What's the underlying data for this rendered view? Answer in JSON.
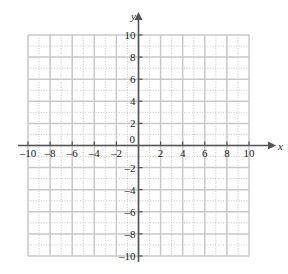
{
  "figure": {
    "title": "",
    "axis_labels": {
      "x": "x",
      "y": "y"
    },
    "origin_label": "0"
  },
  "chart_data": {
    "type": "scatter",
    "title": "",
    "xlabel": "x",
    "ylabel": "y",
    "xlim": [
      -10,
      10
    ],
    "ylim": [
      -10,
      10
    ],
    "grid": true,
    "grid_major_step": 2,
    "grid_minor_step": 1,
    "legend": "none",
    "series": [],
    "x_tick_labels": [
      "-10",
      "-8",
      "-6",
      "-4",
      "-2",
      "0",
      "2",
      "4",
      "6",
      "8",
      "10"
    ],
    "y_tick_labels": [
      "-10",
      "-8",
      "-6",
      "-4",
      "-2",
      "0",
      "2",
      "4",
      "6",
      "8",
      "10"
    ],
    "x_tick_values": [
      -10,
      -8,
      -6,
      -4,
      -2,
      0,
      2,
      4,
      6,
      8,
      10
    ],
    "y_tick_values": [
      -10,
      -8,
      -6,
      -4,
      -2,
      0,
      2,
      4,
      6,
      8,
      10
    ],
    "annotations": []
  },
  "ticks": {
    "x_negative": [
      {
        "value": -10,
        "label": "–10"
      },
      {
        "value": -8,
        "label": "–8"
      },
      {
        "value": -6,
        "label": "–6"
      },
      {
        "value": -4,
        "label": "–4"
      },
      {
        "value": -2,
        "label": "–2"
      }
    ],
    "x_positive": [
      {
        "value": 2,
        "label": "2"
      },
      {
        "value": 4,
        "label": "4"
      },
      {
        "value": 6,
        "label": "6"
      },
      {
        "value": 8,
        "label": "8"
      },
      {
        "value": 10,
        "label": "10"
      }
    ],
    "y_positive": [
      {
        "value": 2,
        "label": "2"
      },
      {
        "value": 4,
        "label": "4"
      },
      {
        "value": 6,
        "label": "6"
      },
      {
        "value": 8,
        "label": "8"
      },
      {
        "value": 10,
        "label": "10"
      }
    ],
    "y_negative": [
      {
        "value": -2,
        "label": "–2"
      },
      {
        "value": -4,
        "label": "–4"
      },
      {
        "value": -6,
        "label": "–6"
      },
      {
        "value": -8,
        "label": "–8"
      },
      {
        "value": -10,
        "label": "–10"
      }
    ]
  },
  "colors": {
    "background": "#ffffff",
    "axis": "#555555",
    "grid_major": "#c9c9c9",
    "grid_minor": "#b9b9b9",
    "text": "#1c1c1c"
  }
}
